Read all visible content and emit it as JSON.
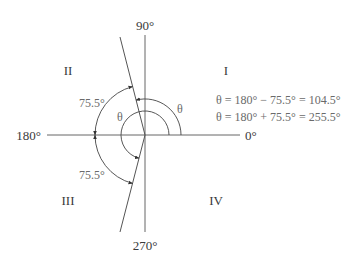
{
  "diagram": {
    "axes": {
      "top": "90°",
      "bottom": "270°",
      "left": "180°",
      "right": "0°"
    },
    "quadrants": [
      "I",
      "II",
      "III",
      "IV"
    ],
    "arc_labels": {
      "reference_upper": "75.5°",
      "reference_lower": "75.5°",
      "theta_outer": "θ",
      "theta_inner": "θ"
    },
    "equations": [
      "θ = 180° − 75.5° = 104.5°",
      "θ = 180° + 75.5° = 255.5°"
    ],
    "angles": {
      "reference_angle_deg": 75.5,
      "theta_1_deg": 104.5,
      "theta_2_deg": 255.5
    },
    "colors": {
      "line": "#555555",
      "text": "#3a3a3a",
      "angle_text": "#6a6a6a",
      "background": "#ffffff"
    }
  }
}
